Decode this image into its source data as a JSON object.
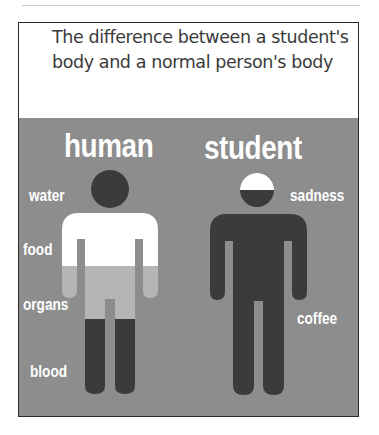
{
  "post": {
    "caption": "The difference between a student's body and a normal person's body"
  },
  "meme": {
    "background_color": "#8d8d8d",
    "human": {
      "title": "human",
      "labels": [
        "water",
        "food",
        "organs",
        "blood"
      ],
      "colors": {
        "head": "#3b3b3b",
        "water": "#ffffff",
        "organs": "#b5b5b5",
        "blood": "#3b3b3b"
      }
    },
    "student": {
      "title": "student",
      "labels": [
        "sadness",
        "coffee"
      ],
      "colors": {
        "head_top": "#ffffff",
        "body": "#3b3b3b"
      }
    }
  }
}
